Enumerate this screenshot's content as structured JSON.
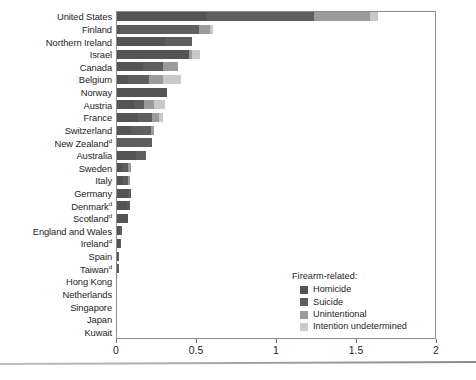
{
  "chart_data": {
    "type": "bar",
    "orientation": "horizontal",
    "stacked": true,
    "title": "",
    "subtitle": "",
    "xlabel": "",
    "ylabel": "",
    "xlim": [
      0,
      2
    ],
    "xticks": [
      0,
      0.5,
      1,
      1.5,
      2
    ],
    "xtick_labels": [
      "0",
      "0.5",
      "1",
      "1.5",
      "2"
    ],
    "grid": false,
    "legend_position": "inside-bottom-right",
    "legend_title": "Firearm-related:",
    "series": [
      {
        "name": "Homicide",
        "color": "#545454",
        "values": [
          0.56,
          0.02,
          0.3,
          0.45,
          0.16,
          0.07,
          0.31,
          0.11,
          0.13,
          0.09,
          0.0,
          0.12,
          0.03,
          0.04,
          0.07,
          0.06,
          0.07,
          0.02,
          0.02,
          0.008,
          0.005,
          0.0,
          0.0,
          0.0,
          0.0,
          0.0
        ]
      },
      {
        "name": "Suicide",
        "color": "#5e5e5e",
        "values": [
          0.67,
          0.49,
          0.17,
          0.0,
          0.13,
          0.13,
          0.0,
          0.06,
          0.09,
          0.12,
          0.22,
          0.06,
          0.04,
          0.03,
          0.02,
          0.02,
          0.0,
          0.01,
          0.005,
          0.003,
          0.004,
          0.0,
          0.0,
          0.0,
          0.0,
          0.0
        ]
      },
      {
        "name": "Unintentional",
        "color": "#9b9b9b",
        "values": [
          0.35,
          0.07,
          0.0,
          0.02,
          0.09,
          0.09,
          0.0,
          0.06,
          0.04,
          0.02,
          0.0,
          0.0,
          0.02,
          0.01,
          0.0,
          0.0,
          0.0,
          0.0,
          0.0,
          0.0,
          0.0,
          0.0,
          0.0,
          0.0,
          0.0,
          0.0
        ]
      },
      {
        "name": "Intention undetermined",
        "color": "#c9c9c9",
        "values": [
          0.05,
          0.02,
          0.0,
          0.05,
          0.0,
          0.11,
          0.0,
          0.07,
          0.03,
          0.0,
          0.0,
          0.0,
          0.0,
          0.0,
          0.0,
          0.0,
          0.0,
          0.0,
          0.0,
          0.0,
          0.0,
          0.0,
          0.0,
          0.0,
          0.0,
          0.0
        ]
      }
    ],
    "categories": [
      {
        "label": "United States",
        "note": "",
        "total": 1.63
      },
      {
        "label": "Finland",
        "note": "",
        "total": 0.6
      },
      {
        "label": "Northern Ireland",
        "note": "",
        "total": 0.47
      },
      {
        "label": "Israel",
        "note": "",
        "total": 0.52
      },
      {
        "label": "Canada",
        "note": "",
        "total": 0.38
      },
      {
        "label": "Belgium",
        "note": "",
        "total": 0.4
      },
      {
        "label": "Norway",
        "note": "",
        "total": 0.31
      },
      {
        "label": "Austria",
        "note": "",
        "total": 0.3
      },
      {
        "label": "France",
        "note": "",
        "total": 0.29
      },
      {
        "label": "Switzerland",
        "note": "",
        "total": 0.23
      },
      {
        "label": "New Zealand",
        "note": "d",
        "total": 0.22
      },
      {
        "label": "Australia",
        "note": "",
        "total": 0.18
      },
      {
        "label": "Sweden",
        "note": "",
        "total": 0.09
      },
      {
        "label": "Italy",
        "note": "",
        "total": 0.08
      },
      {
        "label": "Germany",
        "note": "",
        "total": 0.09
      },
      {
        "label": "Denmark",
        "note": "d",
        "total": 0.08
      },
      {
        "label": "Scotland",
        "note": "d",
        "total": 0.07
      },
      {
        "label": "England and Wales",
        "note": "",
        "total": 0.03
      },
      {
        "label": "Ireland",
        "note": "d",
        "total": 0.025
      },
      {
        "label": "Spain",
        "note": "",
        "total": 0.011
      },
      {
        "label": "Taiwan",
        "note": "d",
        "total": 0.009
      },
      {
        "label": "Hong Kong",
        "note": "",
        "total": 0.0
      },
      {
        "label": "Netherlands",
        "note": "",
        "total": 0.0
      },
      {
        "label": "Singapore",
        "note": "",
        "total": 0.0
      },
      {
        "label": "Japan",
        "note": "",
        "total": 0.0
      },
      {
        "label": "Kuwait",
        "note": "",
        "total": 0.0
      }
    ]
  }
}
